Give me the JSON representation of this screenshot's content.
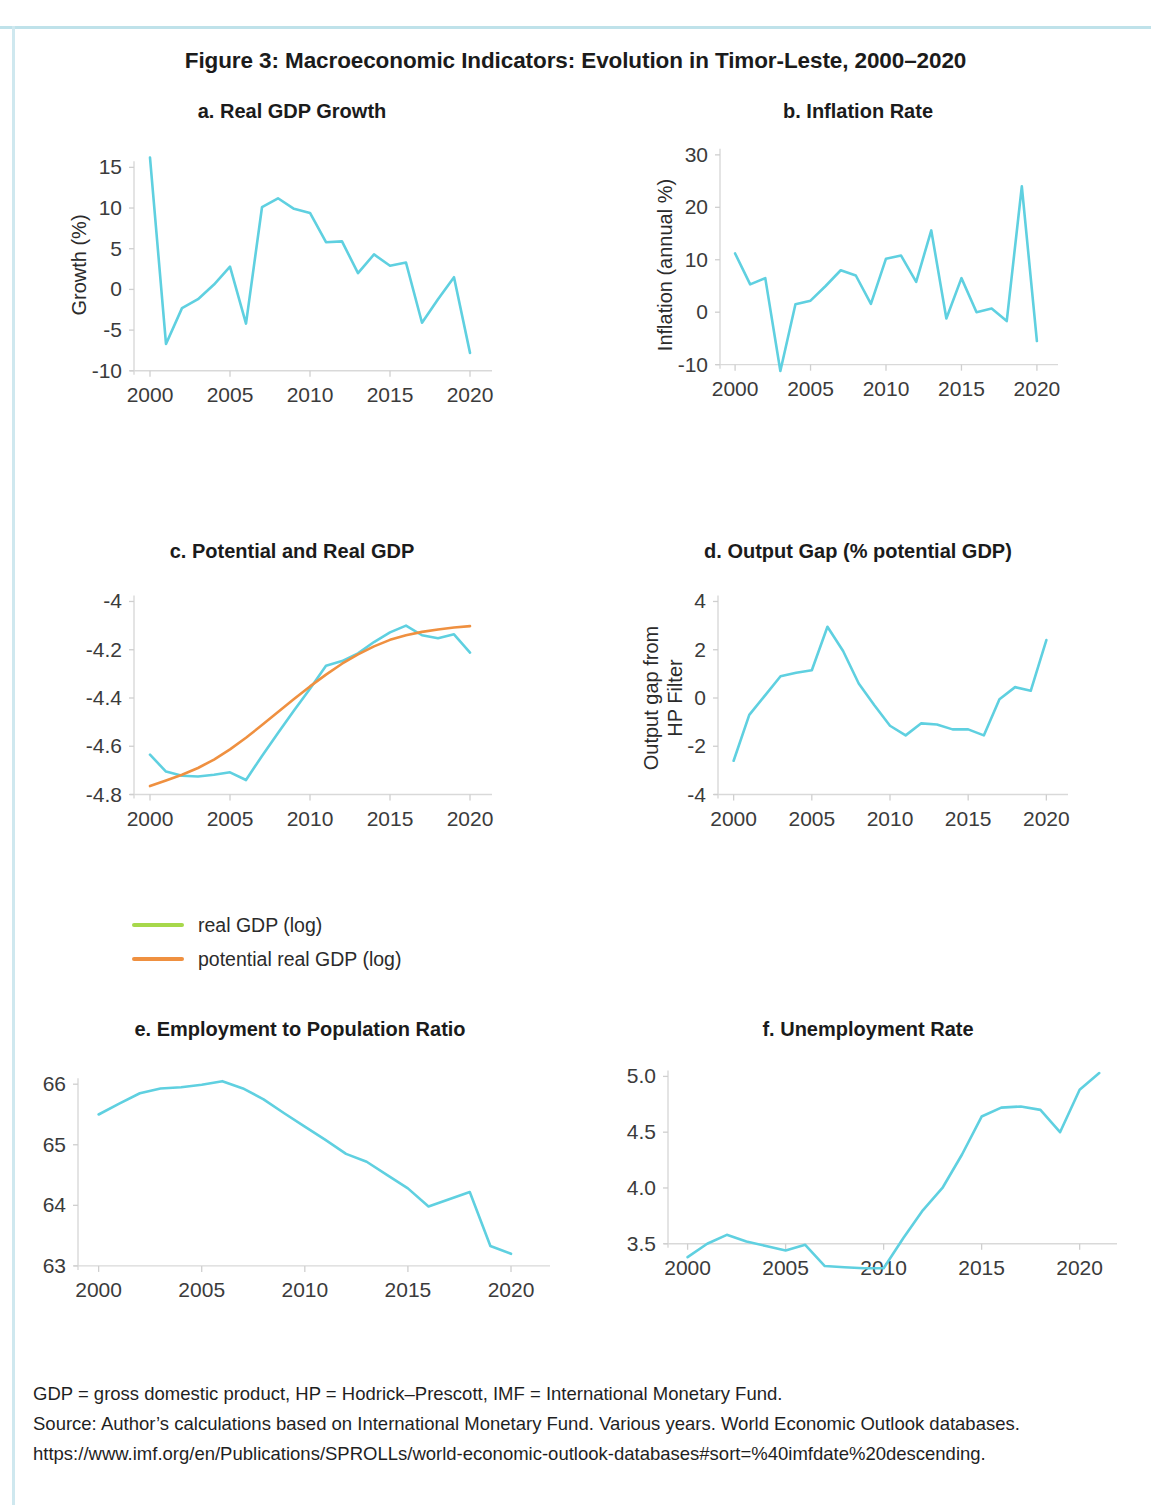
{
  "figure": {
    "title": "Figure 3: Macroeconomic Indicators: Evolution in Timor-Leste, 2000–2020"
  },
  "legend": {
    "items": [
      {
        "label": "real GDP (log)",
        "color": "#a7d84b"
      },
      {
        "label": "potential real GDP (log)",
        "color": "#ef9040"
      }
    ]
  },
  "footnote": {
    "line1": "GDP = gross domestic product, HP = Hodrick–Prescott, IMF = International Monetary Fund.",
    "line2": "Source: Author’s calculations based on International Monetary Fund. Various years. World Economic Outlook databases.",
    "line3": "https://www.imf.org/en/Publications/SPROLLs/world-economic-outlook-databases#sort=%40imfdate%20descending."
  },
  "colors": {
    "line_cyan": "#5fd0e0",
    "line_orange": "#ef9040",
    "legend_green": "#a7d84b",
    "axis": "#d9d9d9",
    "frame": "#bfe2ea"
  },
  "chart_data": [
    {
      "id": "a",
      "type": "line",
      "title": "a. Real GDP Growth",
      "xlabel": "",
      "ylabel": "Growth (%)",
      "xlim": [
        1999.0,
        2021.0
      ],
      "ylim": [
        -11.5,
        17.5
      ],
      "xticks": [
        2000,
        2005,
        2010,
        2015,
        2020
      ],
      "yticks": [
        -10,
        -5,
        0,
        5,
        10,
        15
      ],
      "grid": false,
      "legend_position": "none",
      "x": [
        2000,
        2001,
        2002,
        2003,
        2004,
        2005,
        2006,
        2007,
        2008,
        2009,
        2010,
        2011,
        2012,
        2013,
        2014,
        2015,
        2016,
        2017,
        2018,
        2019,
        2020
      ],
      "series": [
        {
          "name": "Real GDP growth (%)",
          "color": "#5fd0e0",
          "values": [
            16.2,
            -6.7,
            -2.3,
            -1.2,
            0.6,
            2.8,
            -4.2,
            10.1,
            11.2,
            9.9,
            9.4,
            5.8,
            5.9,
            2.0,
            4.3,
            2.9,
            3.3,
            -4.1,
            -1.2,
            1.5,
            -7.8
          ]
        }
      ]
    },
    {
      "id": "b",
      "type": "line",
      "title": "b. Inflation Rate",
      "xlabel": "",
      "ylabel": "Inflation (annual %)",
      "xlim": [
        1999.0,
        2021.0
      ],
      "ylim": [
        -13.5,
        31.5
      ],
      "xticks": [
        2000,
        2005,
        2010,
        2015,
        2020
      ],
      "yticks": [
        -10,
        0,
        10,
        20,
        30
      ],
      "grid": false,
      "legend_position": "none",
      "x": [
        2000,
        2001,
        2002,
        2003,
        2004,
        2005,
        2006,
        2007,
        2008,
        2009,
        2010,
        2011,
        2012,
        2013,
        2014,
        2015,
        2016,
        2017,
        2018,
        2019,
        2020
      ],
      "series": [
        {
          "name": "Inflation (annual %)",
          "color": "#5fd0e0",
          "values": [
            11.2,
            5.3,
            6.5,
            -11.2,
            1.5,
            2.2,
            5.0,
            8.0,
            7.0,
            1.6,
            10.2,
            10.8,
            5.8,
            15.6,
            -1.2,
            6.5,
            0.0,
            0.7,
            -1.7,
            24.0,
            -5.5
          ]
        }
      ]
    },
    {
      "id": "c",
      "type": "line",
      "title": "c. Potential and Real GDP",
      "xlabel": "",
      "ylabel": "",
      "xlim": [
        1999.0,
        2021.0
      ],
      "ylim": [
        -4.86,
        -3.94
      ],
      "xticks": [
        2000,
        2005,
        2010,
        2015,
        2020
      ],
      "yticks": [
        -4.8,
        -4.6,
        -4.4,
        -4.2,
        -4
      ],
      "ytick_labels": [
        "-4.8",
        "-4.6",
        "-4.4",
        "-4.2",
        "-4"
      ],
      "grid": false,
      "legend_position": "below",
      "x": [
        2000,
        2001,
        2002,
        2003,
        2004,
        2005,
        2006,
        2007,
        2008,
        2009,
        2010,
        2011,
        2012,
        2013,
        2014,
        2015,
        2016,
        2017,
        2018,
        2019,
        2020
      ],
      "series": [
        {
          "name": "real GDP (log)",
          "color": "#5fd0e0",
          "values": [
            -4.635,
            -4.705,
            -4.722,
            -4.725,
            -4.718,
            -4.708,
            -4.74,
            -4.64,
            -4.545,
            -4.452,
            -4.362,
            -4.266,
            -4.247,
            -4.215,
            -4.168,
            -4.128,
            -4.1,
            -4.14,
            -4.152,
            -4.136,
            -4.212
          ]
        },
        {
          "name": "potential real GDP (log)",
          "color": "#ef9040",
          "values": [
            -4.765,
            -4.742,
            -4.718,
            -4.69,
            -4.655,
            -4.613,
            -4.565,
            -4.512,
            -4.458,
            -4.404,
            -4.352,
            -4.303,
            -4.258,
            -4.219,
            -4.186,
            -4.159,
            -4.14,
            -4.126,
            -4.116,
            -4.108,
            -4.102
          ]
        }
      ]
    },
    {
      "id": "d",
      "type": "line",
      "title": "d. Output Gap (% potential GDP)",
      "xlabel": "",
      "ylabel": "Output gap from\nHP Filter",
      "xlim": [
        1999.0,
        2021.0
      ],
      "ylim": [
        -4.6,
        4.6
      ],
      "xticks": [
        2000,
        2005,
        2010,
        2015,
        2020
      ],
      "yticks": [
        -4,
        -2,
        0,
        2,
        4
      ],
      "grid": false,
      "legend_position": "none",
      "x": [
        2000,
        2001,
        2002,
        2003,
        2004,
        2005,
        2006,
        2007,
        2008,
        2009,
        2010,
        2011,
        2012,
        2013,
        2014,
        2015,
        2016,
        2017,
        2018,
        2019,
        2020
      ],
      "series": [
        {
          "name": "Output gap from HP Filter",
          "color": "#5fd0e0",
          "values": [
            -2.6,
            -0.7,
            0.1,
            0.9,
            1.05,
            1.15,
            2.95,
            1.95,
            0.6,
            -0.3,
            -1.15,
            -1.55,
            -1.05,
            -1.1,
            -1.3,
            -1.3,
            -1.55,
            -0.05,
            0.45,
            0.3,
            2.4
          ]
        }
      ]
    },
    {
      "id": "e",
      "type": "line",
      "title": "e. Employment to Population Ratio",
      "xlabel": "",
      "ylabel": "",
      "xlim": [
        1999.0,
        2021.6
      ],
      "ylim": [
        62.85,
        66.35
      ],
      "xticks": [
        2000,
        2005,
        2010,
        2015,
        2020
      ],
      "yticks": [
        63,
        64,
        65,
        66
      ],
      "grid": false,
      "legend_position": "none",
      "x": [
        2000,
        2001,
        2002,
        2003,
        2004,
        2005,
        2006,
        2007,
        2008,
        2009,
        2010,
        2011,
        2012,
        2013,
        2014,
        2015,
        2016,
        2017,
        2018,
        2019,
        2020
      ],
      "series": [
        {
          "name": "Employment to population ratio (%)",
          "color": "#5fd0e0",
          "values": [
            65.5,
            65.68,
            65.85,
            65.93,
            65.95,
            65.99,
            66.05,
            65.93,
            65.75,
            65.52,
            65.3,
            65.08,
            64.85,
            64.72,
            64.5,
            64.28,
            63.98,
            64.1,
            64.22,
            63.33,
            63.2
          ]
        }
      ]
    },
    {
      "id": "f",
      "type": "line",
      "title": "f. Unemployment Rate",
      "xlabel": "",
      "ylabel": "",
      "xlim": [
        1999.0,
        2021.6
      ],
      "ylim": [
        3.22,
        5.12
      ],
      "xticks": [
        2000,
        2005,
        2010,
        2015,
        2020
      ],
      "yticks": [
        3.5,
        4.0,
        4.5,
        5.0
      ],
      "ytick_labels": [
        "3.5",
        "4.0",
        "4.5",
        "5.0"
      ],
      "grid": false,
      "legend_position": "none",
      "x": [
        2000,
        2001,
        2002,
        2003,
        2004,
        2005,
        2006,
        2007,
        2008,
        2009,
        2010,
        2011,
        2012,
        2013,
        2014,
        2015,
        2016,
        2017,
        2018,
        2019,
        2020,
        2021
      ],
      "series": [
        {
          "name": "Unemployment rate (%)",
          "color": "#5fd0e0",
          "values": [
            3.38,
            3.5,
            3.58,
            3.52,
            3.48,
            3.44,
            3.49,
            3.3,
            3.29,
            3.28,
            3.28,
            3.55,
            3.8,
            4.0,
            4.3,
            4.64,
            4.72,
            4.73,
            4.7,
            4.5,
            4.88,
            5.03
          ]
        }
      ]
    }
  ]
}
